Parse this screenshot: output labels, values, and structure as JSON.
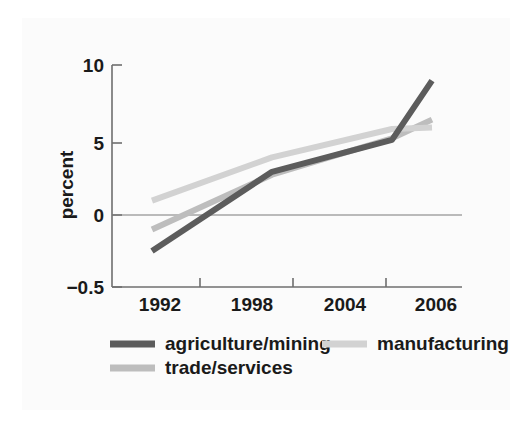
{
  "figure": {
    "background_color": "#fbfbfb",
    "outer_background_color": "#ffffff"
  },
  "chart_data": {
    "type": "line",
    "title": "",
    "subtitle": "",
    "xlabel": "",
    "ylabel": "percent",
    "x": [
      1992,
      1998,
      2004,
      2006
    ],
    "categories": [
      "1992",
      "1998",
      "2004",
      "2006"
    ],
    "xtick_labels": [
      "1992",
      "1998",
      "2004",
      "2006"
    ],
    "ytick_labels": [
      "10",
      "5",
      "0",
      "−0.5"
    ],
    "ytick_values": [
      10,
      5,
      0,
      -0.5
    ],
    "ylim": [
      -0.5,
      10
    ],
    "xlim": [
      1992,
      2006
    ],
    "grid": false,
    "zero_line": true,
    "legend_position": "below-axes",
    "series": [
      {
        "name": "agriculture/mining",
        "color": "#5c5c5c",
        "linewidth": 6,
        "values": [
          -0.25,
          3.0,
          5.2,
          9.0
        ]
      },
      {
        "name": "manufacturing",
        "color": "#d2d2d2",
        "linewidth": 6,
        "values": [
          1.0,
          4.0,
          5.9,
          6.0
        ]
      },
      {
        "name": "trade/services",
        "color": "#bdbdbd",
        "linewidth": 6,
        "values": [
          -0.1,
          2.8,
          5.3,
          6.5
        ]
      }
    ]
  },
  "axes": {
    "y_axis_label": "percent",
    "y_ticks": [
      {
        "label": "10",
        "value": 10
      },
      {
        "label": "5",
        "value": 5
      },
      {
        "label": "0",
        "value": 0
      },
      {
        "label": "−0.5",
        "value": -0.5
      }
    ],
    "x_ticks": [
      {
        "label": "1992",
        "value": 1992
      },
      {
        "label": "1998",
        "value": 1998
      },
      {
        "label": "2004",
        "value": 2004
      },
      {
        "label": "2006",
        "value": 2006
      }
    ]
  },
  "legend": {
    "entries": [
      {
        "label": "agriculture/mining",
        "color": "#5c5c5c"
      },
      {
        "label": "manufacturing",
        "color": "#d2d2d2"
      },
      {
        "label": "trade/services",
        "color": "#bdbdbd"
      }
    ]
  }
}
